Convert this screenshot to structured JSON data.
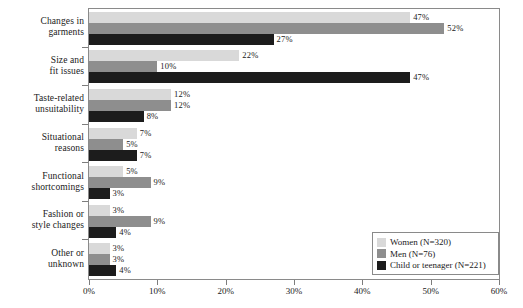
{
  "chart_data": {
    "type": "bar",
    "orientation": "horizontal",
    "title": "",
    "subtitle": "",
    "xlabel": "",
    "ylabel": "",
    "xlim": [
      0,
      60
    ],
    "xtick_labels": [
      "0%",
      "10%",
      "20%",
      "30%",
      "40%",
      "50%",
      "60%"
    ],
    "xtick_values": [
      0,
      10,
      20,
      30,
      40,
      50,
      60
    ],
    "grid": false,
    "legend_position": "bottom-right",
    "categories": [
      "Changes in garments",
      "Size and fit issues",
      "Taste-related unsuitability",
      "Situational reasons",
      "Functional shortcomings",
      "Fashion or style changes",
      "Other or unknown"
    ],
    "category_lines": [
      [
        "Changes in",
        "garments"
      ],
      [
        "Size and",
        "fit issues"
      ],
      [
        "Taste-related",
        "unsuitability"
      ],
      [
        "Situational",
        "reasons"
      ],
      [
        "Functional",
        "shortcomings"
      ],
      [
        "Fashion or",
        "style changes"
      ],
      [
        "Other or",
        "unknown"
      ]
    ],
    "series": [
      {
        "name": "Women (N=320)",
        "color": "#d9d9d9",
        "values": [
          47,
          22,
          12,
          7,
          5,
          3,
          3
        ],
        "labels": [
          "47%",
          "22%",
          "12%",
          "7%",
          "5%",
          "3%",
          "3%"
        ]
      },
      {
        "name": "Men (N=76)",
        "color": "#8e8e8e",
        "values": [
          52,
          10,
          12,
          5,
          9,
          9,
          3
        ],
        "labels": [
          "52%",
          "10%",
          "12%",
          "5%",
          "9%",
          "9%",
          "3%"
        ]
      },
      {
        "name": "Child or teenager (N=221)",
        "color": "#1c1c1c",
        "values": [
          27,
          47,
          8,
          7,
          3,
          4,
          4
        ],
        "labels": [
          "27%",
          "47%",
          "8%",
          "7%",
          "3%",
          "4%",
          "4%"
        ]
      }
    ]
  },
  "legend": {
    "items": [
      {
        "label": "Women (N=320)",
        "color": "#d9d9d9"
      },
      {
        "label": "Men (N=76)",
        "color": "#8e8e8e"
      },
      {
        "label": "Child or teenager (N=221)",
        "color": "#1c1c1c"
      }
    ]
  }
}
